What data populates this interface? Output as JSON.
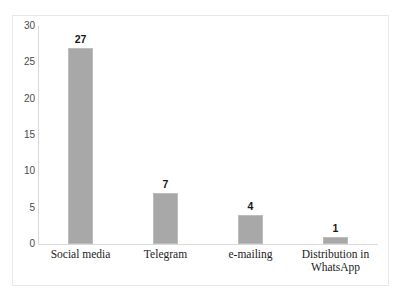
{
  "chart_data": {
    "type": "bar",
    "title": "",
    "subtitle": "",
    "xlabel": "",
    "ylabel": "",
    "categories": [
      "Social media",
      "Telegram",
      "e-mailing",
      "Distribution in WhatsApp"
    ],
    "category_lines": [
      [
        "Social media"
      ],
      [
        "Telegram"
      ],
      [
        "e-mailing"
      ],
      [
        "Distribution in",
        "WhatsApp"
      ]
    ],
    "values": [
      27,
      7,
      4,
      1
    ],
    "value_labels": [
      "27",
      "7",
      "4",
      "1"
    ],
    "ylim": [
      0,
      30
    ],
    "ytick_labels": [
      "0",
      "5",
      "10",
      "15",
      "20",
      "25",
      "30"
    ],
    "ytick_values": [
      0,
      5,
      10,
      15,
      20,
      25,
      30
    ],
    "grid": false,
    "legend": false,
    "legend_position": "none",
    "bar_color": "#a8a8a8",
    "bar_edge_color": "#bdbdbd",
    "axis_color": "#d9d9d9",
    "frame_color": "#e8e8e8",
    "background_color": "#ffffff",
    "tick_label_color": "#4a4a4a",
    "value_label_color": "#171717",
    "category_label_color": "#222222"
  }
}
